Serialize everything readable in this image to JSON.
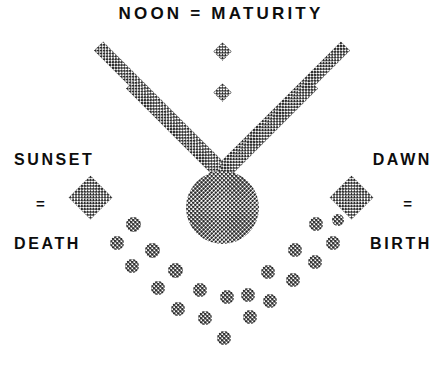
{
  "diagram": {
    "title": "NOON = MATURITY",
    "left": {
      "top_label": "SUNSET",
      "equals": "=",
      "bottom_label": "DEATH"
    },
    "right": {
      "top_label": "DAWN",
      "equals": "=",
      "bottom_label": "BIRTH"
    },
    "colors": {
      "background": "#ffffff",
      "ink": "#0d0d0d",
      "halftone": "#2b2b2b"
    },
    "shapes": {
      "sun_circle": {
        "cx": 222,
        "cy": 207,
        "d": 73
      },
      "chevron": {
        "apex_outer_y": 45,
        "apex_inner_y": 88,
        "band_thickness": 13,
        "arms": [
          {
            "name": "outer-left",
            "x": 92,
            "y": 46,
            "w": 13,
            "h": 190,
            "rot": -45
          },
          {
            "name": "outer-right",
            "x": 339,
            "y": 46,
            "w": 13,
            "h": 190,
            "rot": 45
          },
          {
            "name": "inner-left",
            "x": 124,
            "y": 82,
            "w": 13,
            "h": 160,
            "rot": -45
          },
          {
            "name": "inner-right",
            "x": 307,
            "y": 82,
            "w": 13,
            "h": 160,
            "rot": 45
          }
        ]
      },
      "diamonds": [
        {
          "name": "sunset-diamond",
          "x": 75,
          "y": 182,
          "size": 31
        },
        {
          "name": "dawn-diamond",
          "x": 336,
          "y": 182,
          "size": 31
        }
      ],
      "dots": [
        {
          "cx": 133,
          "cy": 224,
          "d": 15
        },
        {
          "cx": 117,
          "cy": 243,
          "d": 14
        },
        {
          "cx": 152,
          "cy": 250,
          "d": 15
        },
        {
          "cx": 132,
          "cy": 266,
          "d": 14
        },
        {
          "cx": 175,
          "cy": 270,
          "d": 15
        },
        {
          "cx": 158,
          "cy": 288,
          "d": 14
        },
        {
          "cx": 200,
          "cy": 290,
          "d": 14
        },
        {
          "cx": 178,
          "cy": 309,
          "d": 14
        },
        {
          "cx": 227,
          "cy": 297,
          "d": 14
        },
        {
          "cx": 205,
          "cy": 318,
          "d": 14
        },
        {
          "cx": 224,
          "cy": 338,
          "d": 14
        },
        {
          "cx": 250,
          "cy": 317,
          "d": 14
        },
        {
          "cx": 248,
          "cy": 295,
          "d": 14
        },
        {
          "cx": 270,
          "cy": 301,
          "d": 14
        },
        {
          "cx": 268,
          "cy": 272,
          "d": 14
        },
        {
          "cx": 293,
          "cy": 280,
          "d": 14
        },
        {
          "cx": 295,
          "cy": 250,
          "d": 14
        },
        {
          "cx": 315,
          "cy": 262,
          "d": 14
        },
        {
          "cx": 316,
          "cy": 224,
          "d": 14
        },
        {
          "cx": 333,
          "cy": 243,
          "d": 14
        },
        {
          "cx": 338,
          "cy": 220,
          "d": 12
        }
      ]
    }
  }
}
